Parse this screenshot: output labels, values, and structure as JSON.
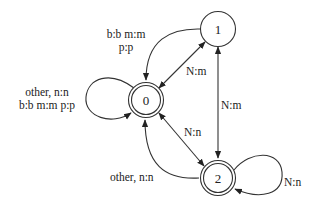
{
  "diagram": {
    "type": "finite-state-transducer",
    "nodes": [
      {
        "id": "0",
        "label": "0",
        "accepting": true
      },
      {
        "id": "1",
        "label": "1",
        "accepting": false
      },
      {
        "id": "2",
        "label": "2",
        "accepting": true
      }
    ],
    "edges": [
      {
        "from": "1",
        "to": "0",
        "label_line1": "b:b m:m",
        "label_line2": "p:p"
      },
      {
        "from": "0",
        "to": "0",
        "label_line1": "other, n:n",
        "label_line2": "b:b m:m p:p"
      },
      {
        "from": "0",
        "to": "1",
        "label": "N:m",
        "bidirectional": true
      },
      {
        "from": "1",
        "to": "2",
        "label": "N:m",
        "bidirectional": true
      },
      {
        "from": "0",
        "to": "2",
        "label": "N:n",
        "bidirectional": true
      },
      {
        "from": "2",
        "to": "0",
        "label": "other, n:n"
      },
      {
        "from": "2",
        "to": "2",
        "label": "N:n"
      }
    ]
  }
}
